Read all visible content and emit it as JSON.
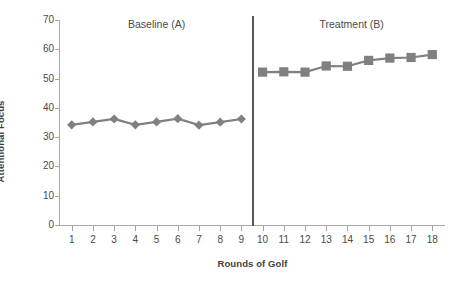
{
  "chart_data": {
    "type": "line",
    "title": "",
    "xlabel": "Rounds of Golf",
    "ylabel": "Attentional Focus",
    "x": [
      1,
      2,
      3,
      4,
      5,
      6,
      7,
      8,
      9,
      10,
      11,
      12,
      13,
      14,
      15,
      16,
      17,
      18
    ],
    "xtick_labels": [
      "1",
      "2",
      "3",
      "4",
      "5",
      "6",
      "7",
      "8",
      "9",
      "10",
      "11",
      "12",
      "13",
      "14",
      "15",
      "16",
      "17",
      "18"
    ],
    "ytick_labels": [
      "0",
      "10",
      "20",
      "30",
      "40",
      "50",
      "60",
      "70"
    ],
    "yticks": [
      0,
      10,
      20,
      30,
      40,
      50,
      60,
      70
    ],
    "ylim": [
      0,
      70
    ],
    "xlim": [
      0.4,
      18.6
    ],
    "grid": false,
    "legend": false,
    "series": [
      {
        "name": "Baseline (A)",
        "marker": "diamond",
        "color": "#808080",
        "x": [
          1,
          2,
          3,
          4,
          5,
          6,
          7,
          8,
          9
        ],
        "values": [
          34.2,
          35.2,
          36.2,
          34.2,
          35.2,
          36.3,
          34.1,
          35.1,
          36.2
        ]
      },
      {
        "name": "Treatment (B)",
        "marker": "square",
        "color": "#808080",
        "x": [
          10,
          11,
          12,
          13,
          14,
          15,
          16,
          17,
          18
        ],
        "values": [
          52.2,
          52.3,
          52.2,
          54.3,
          54.2,
          56.2,
          57.0,
          57.2,
          58.2
        ]
      }
    ],
    "annotations": [
      {
        "name": "phase-divider",
        "type": "vline",
        "x": 9.5,
        "color": "#595959"
      }
    ],
    "phase_labels": [
      {
        "text": "Baseline (A)",
        "x": 5.0
      },
      {
        "text": "Treatment (B)",
        "x": 14.2
      }
    ]
  }
}
